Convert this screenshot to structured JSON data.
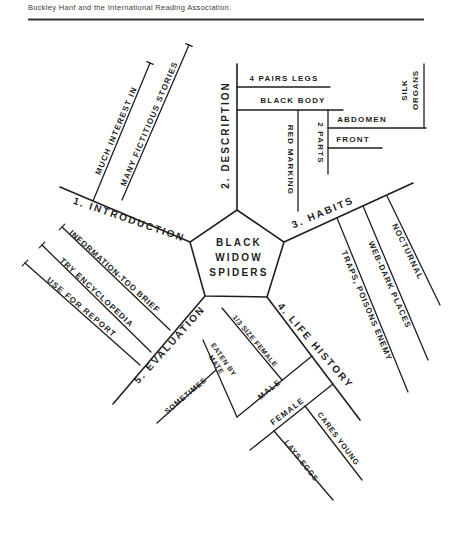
{
  "header": {
    "caption": "Buckley Hanf and the International Reading Association."
  },
  "center": {
    "title_line1": "BLACK",
    "title_line2": "WIDOW",
    "title_line3": "SPIDERS"
  },
  "branches": {
    "introduction": {
      "label": "1. INTRODUCTION",
      "much_interest": "MUCH INTEREST IN",
      "fictitious_stories": "MANY FICTITIOUS STORIES"
    },
    "description": {
      "label": "2. DESCRIPTION",
      "pairs_legs": "4 PAIRS LEGS",
      "black_body": "BLACK BODY",
      "red_marking": "RED MARKING",
      "two_parts": "2 PARTS",
      "abdomen": "ABDOMEN",
      "front": "FRONT",
      "silk_line1": "SILK",
      "silk_line2": "ORGANS"
    },
    "habits": {
      "label": "3. HABITS",
      "nocturnal": "NOCTURNAL",
      "web_dark_places": "WEB-DARK PLACES",
      "traps_poisons_enemy": "TRAPS, POISONS ENEMY"
    },
    "life_history": {
      "label": "4. LIFE HISTORY",
      "male": "MALE",
      "size_female": "1/3 SIZE FEMALE",
      "eaten_line1": "EATEN BY",
      "eaten_line2": "MATE",
      "sometimes": "SOMETIMES",
      "female": "FEMALE",
      "cares_young": "CARES YOUNG",
      "lays_eggs": "LAYS EGGS"
    },
    "evaluation": {
      "label": "5. EVALUATION",
      "information": "INFORMATION-TOO BRIEF",
      "encyclopedia": "TRY ENCYCLOPEDIA",
      "report": "USE FOR REPORT"
    }
  },
  "colors": {
    "ink": "#1f1f1f",
    "paper": "#ffffff"
  }
}
